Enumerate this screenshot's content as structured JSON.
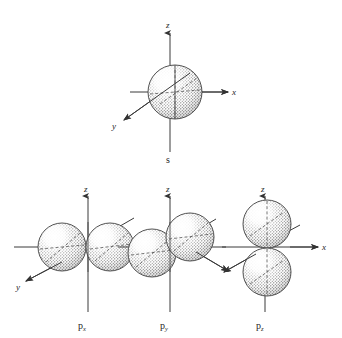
{
  "figure": {
    "background_color": "#ffffff",
    "ink_color": "#2b2b2b",
    "style": "stippled pen-and-ink textbook line drawing"
  },
  "diagrams": [
    {
      "id": "s-orbital",
      "label": "s",
      "shape": "single sphere centered on origin",
      "lobes": 1,
      "axes": [
        {
          "name": "z-axis",
          "label": "z",
          "direction": "up"
        },
        {
          "name": "x-axis",
          "label": "x",
          "direction": "right"
        },
        {
          "name": "y-axis",
          "label": "y",
          "direction": "down-left (toward viewer)"
        }
      ]
    },
    {
      "id": "px-orbital",
      "label": "p",
      "subscript": "x",
      "shape": "two lobes aligned along the y axis (left-right in view)",
      "lobes": 2,
      "axes": [
        {
          "name": "z-axis",
          "label": "z",
          "direction": "up"
        },
        {
          "name": "y-axis",
          "label": "y",
          "direction": "down-left (toward viewer)"
        },
        {
          "name": "x-axis",
          "label": "",
          "direction": "upper-right (into page)"
        }
      ]
    },
    {
      "id": "py-orbital",
      "label": "p",
      "subscript": "y",
      "shape": "two lobes aligned along the x axis (receding into the page)",
      "lobes": 2,
      "axes": [
        {
          "name": "z-axis",
          "label": "z",
          "direction": "up"
        },
        {
          "name": "x-axis",
          "label": "",
          "direction": "upper-right (into page)"
        },
        {
          "name": "y-axis",
          "label": "",
          "direction": "down-left (toward viewer)"
        }
      ]
    },
    {
      "id": "pz-orbital",
      "label": "p",
      "subscript": "z",
      "shape": "two lobes aligned vertically along the z axis",
      "lobes": 2,
      "axes": [
        {
          "name": "z-axis",
          "label": "z",
          "direction": "up"
        },
        {
          "name": "x-axis",
          "label": "x",
          "direction": "right"
        },
        {
          "name": "y-axis",
          "label": "",
          "direction": "down-left (toward viewer)"
        }
      ]
    }
  ],
  "labels": {
    "s": "s",
    "p": "p",
    "sub_x": "x",
    "sub_y": "y",
    "sub_z": "z",
    "axis_z": "z",
    "axis_x": "x",
    "axis_y": "y"
  }
}
